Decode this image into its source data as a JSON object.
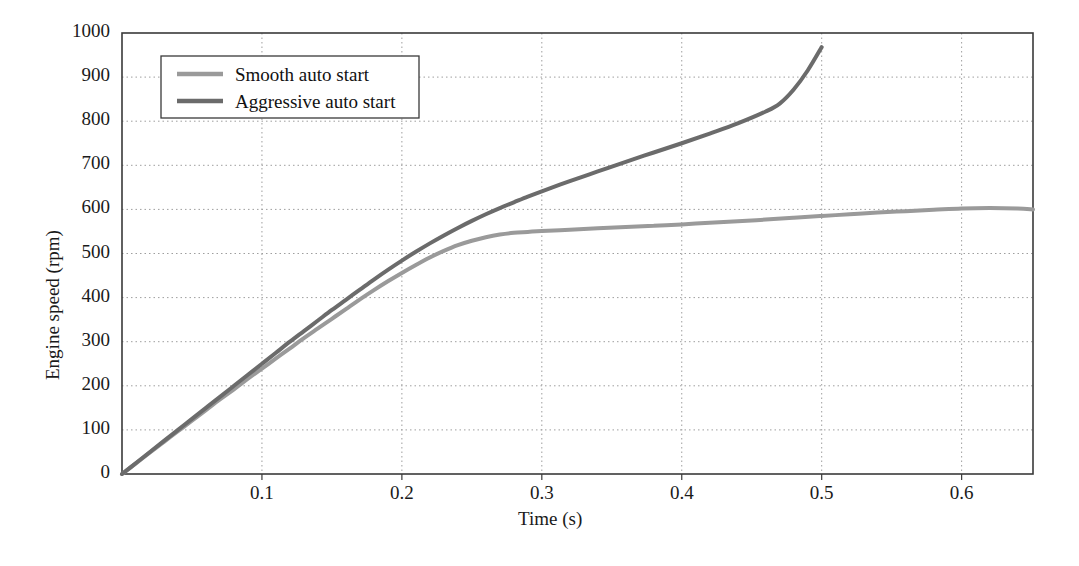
{
  "chart_data": {
    "type": "line",
    "title": "",
    "xlabel": "Time (s)",
    "ylabel": "Engine speed (rpm)",
    "xlim": [
      0,
      0.651
    ],
    "ylim": [
      0,
      1000
    ],
    "grid": true,
    "legend_position": "upper left",
    "xticks": [
      0.1,
      0.2,
      0.3,
      0.4,
      0.5,
      0.6
    ],
    "xtick_labels": [
      "0.1",
      "0.2",
      "0.3",
      "0.4",
      "0.5",
      "0.6"
    ],
    "yticks": [
      0,
      100,
      200,
      300,
      400,
      500,
      600,
      700,
      800,
      900,
      1000
    ],
    "ytick_labels": [
      "0",
      "100",
      "200",
      "300",
      "400",
      "500",
      "600",
      "700",
      "800",
      "900",
      "1000"
    ],
    "series": [
      {
        "name": "Smooth auto start",
        "color": "#9a9a9a",
        "x": [
          0,
          0.01,
          0.02,
          0.03,
          0.04,
          0.05,
          0.06,
          0.07,
          0.08,
          0.09,
          0.1,
          0.11,
          0.12,
          0.13,
          0.14,
          0.15,
          0.16,
          0.17,
          0.18,
          0.19,
          0.2,
          0.21,
          0.22,
          0.23,
          0.24,
          0.25,
          0.26,
          0.27,
          0.28,
          0.29,
          0.3,
          0.32,
          0.34,
          0.36,
          0.38,
          0.4,
          0.42,
          0.44,
          0.46,
          0.48,
          0.5,
          0.52,
          0.54,
          0.56,
          0.58,
          0.6,
          0.62,
          0.64,
          0.651
        ],
        "y": [
          0,
          24,
          49,
          73,
          97,
          121,
          145,
          169,
          192,
          216,
          239,
          262,
          285,
          308,
          330,
          352,
          374,
          396,
          417,
          437,
          456,
          474,
          491,
          506,
          519,
          529,
          537,
          543,
          547,
          549,
          551,
          554,
          557,
          560,
          563,
          566,
          570,
          573,
          577,
          581,
          585,
          589,
          593,
          596,
          599,
          602,
          603,
          602,
          600
        ]
      },
      {
        "name": "Aggressive auto start",
        "color": "#6b6b6b",
        "x": [
          0,
          0.01,
          0.02,
          0.03,
          0.04,
          0.05,
          0.06,
          0.07,
          0.08,
          0.09,
          0.1,
          0.11,
          0.12,
          0.13,
          0.14,
          0.15,
          0.16,
          0.17,
          0.18,
          0.19,
          0.2,
          0.21,
          0.22,
          0.23,
          0.24,
          0.25,
          0.26,
          0.27,
          0.28,
          0.29,
          0.3,
          0.32,
          0.34,
          0.36,
          0.38,
          0.4,
          0.42,
          0.44,
          0.46,
          0.47,
          0.48,
          0.49,
          0.5
        ],
        "y": [
          0,
          25,
          50,
          75,
          100,
          125,
          150,
          175,
          200,
          225,
          250,
          275,
          300,
          324,
          348,
          372,
          395,
          418,
          441,
          463,
          484,
          504,
          523,
          541,
          558,
          574,
          589,
          603,
          616,
          629,
          641,
          664,
          686,
          708,
          729,
          750,
          772,
          795,
          822,
          840,
          872,
          915,
          968
        ]
      }
    ]
  },
  "legend": {
    "items": [
      {
        "label": "Smooth auto start"
      },
      {
        "label": "Aggressive auto start"
      }
    ]
  }
}
